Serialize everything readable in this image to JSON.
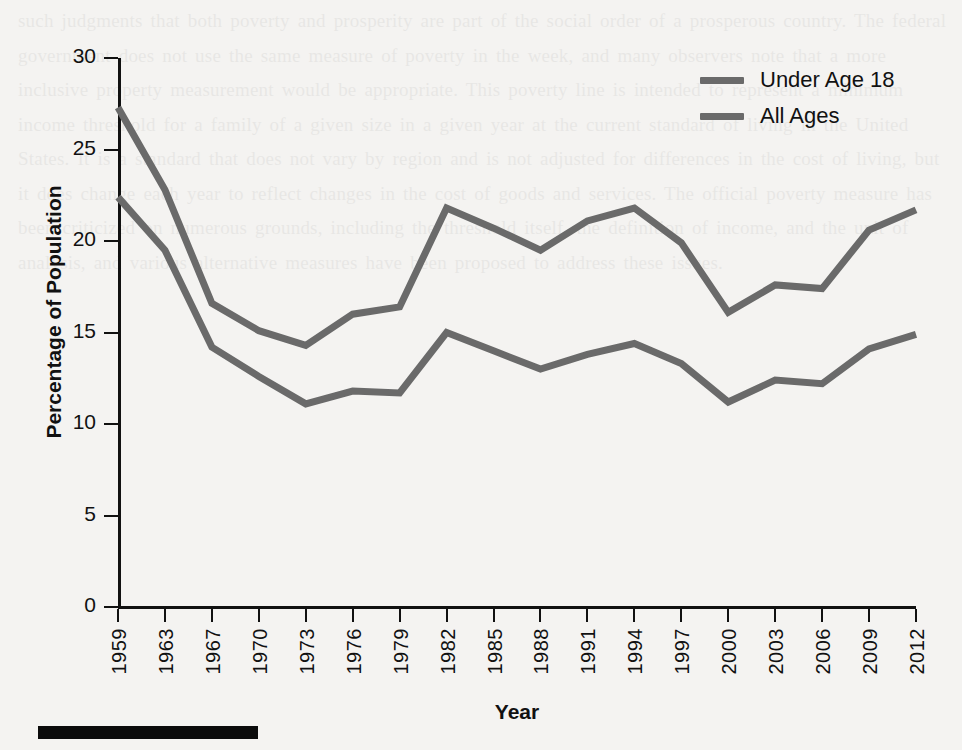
{
  "figure": {
    "background_color": "#f4f3f1",
    "line_color": "#6a6a6a",
    "axis_color": "#111111"
  },
  "axes": {
    "y_title": "Percentage of Population",
    "x_title": "Year",
    "y_ticks": [
      "0",
      "5",
      "10",
      "15",
      "20",
      "25",
      "30"
    ],
    "x_ticks": [
      "1959",
      "1963",
      "1967",
      "1970",
      "1973",
      "1976",
      "1979",
      "1982",
      "1985",
      "1988",
      "1991",
      "1994",
      "1997",
      "2000",
      "2003",
      "2006",
      "2009",
      "2012"
    ]
  },
  "legend": {
    "position": "top-right",
    "entries": [
      {
        "label": "Under Age 18",
        "color": "#6a6a6a"
      },
      {
        "label": "All Ages",
        "color": "#6a6a6a"
      }
    ]
  },
  "artifact": {
    "name": "black-bar",
    "color": "#0b0b0b"
  },
  "chart_data": {
    "type": "line",
    "title": "",
    "subtitle": "",
    "xlabel": "Year",
    "ylabel": "Percentage of Population",
    "xlim": [
      "1959",
      "2012"
    ],
    "ylim": [
      0,
      30
    ],
    "y_ticks": [
      0,
      5,
      10,
      15,
      20,
      25,
      30
    ],
    "grid": false,
    "legend_position": "top-right",
    "categories": [
      "1959",
      "1963",
      "1967",
      "1970",
      "1973",
      "1976",
      "1979",
      "1982",
      "1985",
      "1988",
      "1991",
      "1994",
      "1997",
      "2000",
      "2003",
      "2006",
      "2009",
      "2012"
    ],
    "series": [
      {
        "name": "Under Age 18",
        "color": "#6a6a6a",
        "values": [
          27.3,
          22.8,
          16.6,
          15.1,
          14.3,
          16.0,
          16.4,
          21.8,
          20.7,
          19.5,
          21.1,
          21.8,
          19.9,
          16.1,
          17.6,
          17.4,
          20.6,
          21.7
        ]
      },
      {
        "name": "All Ages",
        "color": "#6a6a6a",
        "values": [
          22.4,
          19.5,
          14.2,
          12.6,
          11.1,
          11.8,
          11.7,
          15.0,
          14.0,
          13.0,
          13.8,
          14.4,
          13.3,
          11.2,
          12.4,
          12.2,
          14.1,
          14.9
        ]
      }
    ]
  },
  "page_bleed_text": "such judgments that both poverty and prosperity are part of the social order of a prosperous country. The federal government does not use the same measure of poverty in the week, and many observers note that a more inclusive property measurement would be appropriate. This poverty line is intended to represent a minimum income threshold for a family of a given size in a given year at the current standard of living in the United States. It is a standard that does not vary by region and is not adjusted for differences in the cost of living, but it does change each year to reflect changes in the cost of goods and services. The official poverty measure has been criticized on numerous grounds, including the threshold itself, the definition of income, and the unit of analysis, and various alternative measures have been proposed to address these issues."
}
